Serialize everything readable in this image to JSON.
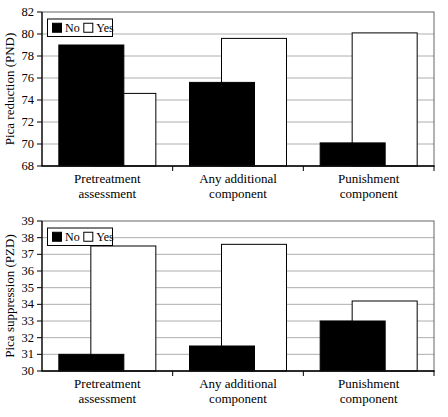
{
  "figure": {
    "background": "#ffffff",
    "colors": {
      "no_fill": "#000000",
      "yes_fill": "#ffffff",
      "bar_outline": "#000000",
      "gridline": "#999999",
      "border": "#555555",
      "axis": "#000000",
      "text": "#000000",
      "legend_bg": "#ffffff"
    }
  },
  "chart_data": [
    {
      "type": "bar",
      "title": "",
      "ylabel": "Pica reduction (PND)",
      "xlabel": "",
      "ylim": [
        68,
        82
      ],
      "ytick_step": 2,
      "grid": true,
      "legend_position": "top-left",
      "bar_style": "overlapped",
      "categories": [
        {
          "label": "Pretreatment assessment",
          "lines": [
            "Pretreatment",
            "assessment"
          ]
        },
        {
          "label": "Any additional component",
          "lines": [
            "Any additional",
            "component"
          ]
        },
        {
          "label": "Punishment component",
          "lines": [
            "Punishment",
            "component"
          ]
        }
      ],
      "series": [
        {
          "name": "No",
          "fill": "#000000",
          "values": [
            79.0,
            75.6,
            70.1
          ]
        },
        {
          "name": "Yes",
          "fill": "#ffffff",
          "values": [
            74.6,
            79.6,
            80.1
          ]
        }
      ]
    },
    {
      "type": "bar",
      "title": "",
      "ylabel": "Pica suppression (PZD)",
      "xlabel": "",
      "ylim": [
        30,
        39
      ],
      "ytick_step": 1,
      "grid": true,
      "legend_position": "top-left",
      "bar_style": "overlapped",
      "categories": [
        {
          "label": "Pretreatment assessment",
          "lines": [
            "Pretreatment",
            "assessment"
          ]
        },
        {
          "label": "Any additional component",
          "lines": [
            "Any additional",
            "component"
          ]
        },
        {
          "label": "Punishment component",
          "lines": [
            "Punishment",
            "component"
          ]
        }
      ],
      "series": [
        {
          "name": "No",
          "fill": "#000000",
          "values": [
            31.0,
            31.5,
            33.0
          ]
        },
        {
          "name": "Yes",
          "fill": "#ffffff",
          "values": [
            37.5,
            37.6,
            34.2
          ]
        }
      ]
    }
  ]
}
